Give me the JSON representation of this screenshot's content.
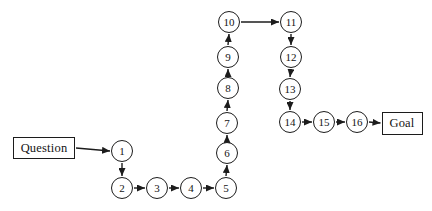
{
  "diagram": {
    "background_color": "#ffffff",
    "stroke_color": "#1c1c1c",
    "node_fill": "#ffffff",
    "node_radius": 11,
    "nodes": [
      {
        "id": "question",
        "type": "box",
        "label": "Question",
        "x": 44,
        "y": 148,
        "w": 62,
        "h": 22
      },
      {
        "id": "1",
        "type": "circle",
        "label": "1",
        "x": 122,
        "y": 151
      },
      {
        "id": "2",
        "type": "circle",
        "label": "2",
        "x": 122,
        "y": 188
      },
      {
        "id": "3",
        "type": "circle",
        "label": "3",
        "x": 157,
        "y": 188
      },
      {
        "id": "4",
        "type": "circle",
        "label": "4",
        "x": 191,
        "y": 188
      },
      {
        "id": "5",
        "type": "circle",
        "label": "5",
        "x": 226,
        "y": 188
      },
      {
        "id": "6",
        "type": "circle",
        "label": "6",
        "x": 227,
        "y": 153
      },
      {
        "id": "7",
        "type": "circle",
        "label": "7",
        "x": 227,
        "y": 123
      },
      {
        "id": "8",
        "type": "circle",
        "label": "8",
        "x": 228,
        "y": 88
      },
      {
        "id": "9",
        "type": "circle",
        "label": "9",
        "x": 228,
        "y": 57
      },
      {
        "id": "10",
        "type": "circle",
        "label": "10",
        "x": 229,
        "y": 22
      },
      {
        "id": "11",
        "type": "circle",
        "label": "11",
        "x": 291,
        "y": 22
      },
      {
        "id": "12",
        "type": "circle",
        "label": "12",
        "x": 291,
        "y": 57
      },
      {
        "id": "13",
        "type": "circle",
        "label": "13",
        "x": 290,
        "y": 89
      },
      {
        "id": "14",
        "type": "circle",
        "label": "14",
        "x": 290,
        "y": 122
      },
      {
        "id": "15",
        "type": "circle",
        "label": "15",
        "x": 324,
        "y": 122
      },
      {
        "id": "16",
        "type": "circle",
        "label": "16",
        "x": 357,
        "y": 122
      },
      {
        "id": "goal",
        "type": "box",
        "label": "Goal",
        "x": 402,
        "y": 123,
        "w": 41,
        "h": 23
      }
    ],
    "edges": [
      {
        "from": "question",
        "to": "1"
      },
      {
        "from": "1",
        "to": "2"
      },
      {
        "from": "2",
        "to": "3"
      },
      {
        "from": "3",
        "to": "4"
      },
      {
        "from": "4",
        "to": "5"
      },
      {
        "from": "5",
        "to": "6"
      },
      {
        "from": "6",
        "to": "7"
      },
      {
        "from": "7",
        "to": "8"
      },
      {
        "from": "8",
        "to": "9"
      },
      {
        "from": "9",
        "to": "10"
      },
      {
        "from": "10",
        "to": "11"
      },
      {
        "from": "11",
        "to": "12"
      },
      {
        "from": "12",
        "to": "13"
      },
      {
        "from": "13",
        "to": "14"
      },
      {
        "from": "14",
        "to": "15"
      },
      {
        "from": "15",
        "to": "16"
      },
      {
        "from": "16",
        "to": "goal"
      }
    ]
  }
}
